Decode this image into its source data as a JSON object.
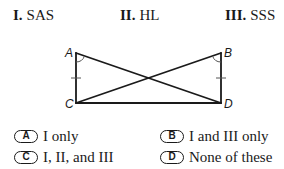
{
  "statements": [
    {
      "numeral": "I.",
      "text": "SAS"
    },
    {
      "numeral": "II.",
      "text": "HL"
    },
    {
      "numeral": "III.",
      "text": "SSS"
    }
  ],
  "figure": {
    "vertices": {
      "A": {
        "label": "A",
        "x": 76,
        "y": 53
      },
      "B": {
        "label": "B",
        "x": 221,
        "y": 53
      },
      "C": {
        "label": "C",
        "x": 76,
        "y": 103
      },
      "D": {
        "label": "D",
        "x": 221,
        "y": 103
      }
    },
    "segments": [
      "AC",
      "BD",
      "CD",
      "AD",
      "BC"
    ],
    "congruence_marks": [
      "AC tick",
      "BD tick"
    ],
    "angle_marks": [
      "angle at A",
      "angle at B"
    ]
  },
  "options": [
    {
      "letter": "A",
      "text": "I only"
    },
    {
      "letter": "B",
      "text": "I and III only"
    },
    {
      "letter": "C",
      "text": "I, II, and III"
    },
    {
      "letter": "D",
      "text": "None of these"
    }
  ]
}
